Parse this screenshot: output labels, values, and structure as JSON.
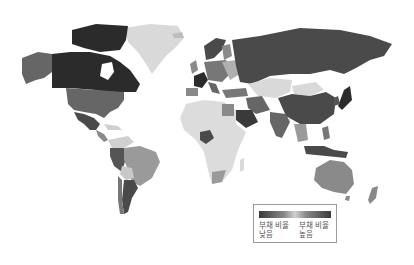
{
  "map": {
    "type": "choropleth",
    "projection": "world",
    "metric": "부채 비율",
    "colors": {
      "very_dark": "#2b2b2b",
      "dark": "#4a4a4a",
      "mid_dark": "#666666",
      "mid": "#8a8a8a",
      "light": "#b5b5b5",
      "very_light": "#d9d9d9",
      "land_default": "#dcdcdc"
    },
    "regions": [
      {
        "name": "Canada",
        "shade": "very_dark"
      },
      {
        "name": "Alaska",
        "shade": "mid_dark"
      },
      {
        "name": "United States",
        "shade": "mid_dark"
      },
      {
        "name": "Greenland",
        "shade": "very_light"
      },
      {
        "name": "Mexico",
        "shade": "dark"
      },
      {
        "name": "Russia",
        "shade": "dark"
      },
      {
        "name": "Kazakhstan",
        "shade": "very_light"
      },
      {
        "name": "China",
        "shade": "dark"
      },
      {
        "name": "Mongolia",
        "shade": "very_light"
      },
      {
        "name": "India",
        "shade": "mid_dark"
      },
      {
        "name": "Japan",
        "shade": "very_dark"
      },
      {
        "name": "Saudi Arabia",
        "shade": "dark"
      },
      {
        "name": "Egypt",
        "shade": "mid"
      },
      {
        "name": "Africa",
        "shade": "very_light"
      },
      {
        "name": "Nigeria",
        "shade": "dark"
      },
      {
        "name": "South Africa",
        "shade": "mid"
      },
      {
        "name": "Brazil",
        "shade": "mid"
      },
      {
        "name": "Argentina",
        "shade": "dark"
      },
      {
        "name": "Peru/Colombia",
        "shade": "mid_dark"
      },
      {
        "name": "Australia",
        "shade": "mid"
      },
      {
        "name": "New Zealand",
        "shade": "mid"
      },
      {
        "name": "Indonesia",
        "shade": "dark"
      },
      {
        "name": "France",
        "shade": "very_dark"
      },
      {
        "name": "Scandinavia",
        "shade": "dark"
      }
    ]
  },
  "legend": {
    "left_label_line1": "부채 비율",
    "left_label_line2": "낮음",
    "right_label_line1": "부채 비율",
    "right_label_line2": "높음",
    "gradient": [
      "#3a3a3a",
      "#8a8a8a",
      "#d0d0d0",
      "#8a8a8a",
      "#3a3a3a"
    ]
  }
}
